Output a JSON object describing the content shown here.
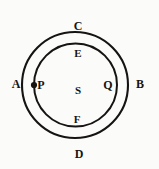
{
  "figure": {
    "kind": "geometric-diagram",
    "background_color": "#fbfbf9",
    "stroke_color": "#161412",
    "width": 159,
    "height": 169
  },
  "shapes": {
    "outer_circle": {
      "name": "outer-circle",
      "cx": 75,
      "cy": 85,
      "r": 53,
      "stroke_width": 2.1
    },
    "inner_circle": {
      "name": "inner-circle",
      "cx": 75.5,
      "cy": 85,
      "r": 41.5,
      "stroke_width": 2.0
    },
    "point_marker": {
      "name": "point-p-marker",
      "cx": 34,
      "cy": 85,
      "r": 3.1
    }
  },
  "labels": {
    "A": {
      "text": "A",
      "x": 16,
      "y": 84
    },
    "B": {
      "text": "B",
      "x": 140,
      "y": 84
    },
    "C": {
      "text": "C",
      "x": 78,
      "y": 26
    },
    "D": {
      "text": "D",
      "x": 79,
      "y": 154
    },
    "E": {
      "text": "E",
      "x": 78,
      "y": 53
    },
    "F": {
      "text": "F",
      "x": 77,
      "y": 119
    },
    "P": {
      "text": "P",
      "x": 41,
      "y": 85
    },
    "Q": {
      "text": "Q",
      "x": 108,
      "y": 85
    },
    "S": {
      "text": "S",
      "x": 78,
      "y": 90
    }
  }
}
